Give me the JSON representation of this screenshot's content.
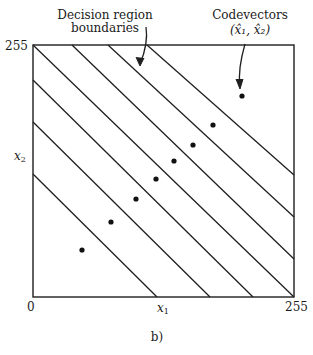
{
  "annotations": {
    "boundaries_label_line1": "Decision region",
    "boundaries_label_line2": "boundaries",
    "codevectors_label_line1": "Codevectors",
    "codevectors_label_line2": "(x̂₁, x̂₂)"
  },
  "axes": {
    "x_label": "x",
    "x_label_sub": "1",
    "y_label": "x",
    "y_label_sub": "2",
    "x_min_label": "0",
    "x_max_label": "255",
    "y_max_label": "255",
    "x_range": [
      0,
      255
    ],
    "y_range": [
      0,
      255
    ]
  },
  "caption": "b)",
  "diagram": {
    "type": "vector-quantization-decision-regions",
    "boundary_lines": 7,
    "boundary_orientation": "parallel diagonal lines, slope -1",
    "codevector_count": 8,
    "codevectors_approx": [
      [
        48,
        47
      ],
      [
        76,
        74
      ],
      [
        101,
        97
      ],
      [
        120,
        116
      ],
      [
        138,
        134
      ],
      [
        155,
        150
      ],
      [
        175,
        170
      ],
      [
        204,
        199
      ]
    ],
    "colors": {
      "line": "#1f1f1f",
      "dot": "#111111",
      "background": "#ffffff"
    }
  }
}
